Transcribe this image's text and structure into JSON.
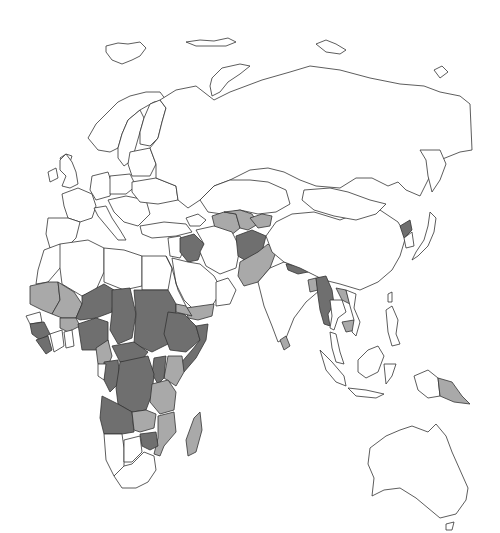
{
  "map": {
    "type": "choropleth",
    "region": "Eurasia, Africa and Oceania",
    "projection_hint": "equal-area-like",
    "colors": {
      "none": "#ffffff",
      "low": "#a9a9a9",
      "high": "#6f6f6f",
      "border": "#333333"
    },
    "categories": [
      "none",
      "low",
      "high"
    ],
    "shaded_countries": {
      "high": [
        "Mali",
        "Niger",
        "Chad",
        "Sudan",
        "Ethiopia",
        "Somalia",
        "Nigeria",
        "Central African Republic",
        "Democratic Republic of the Congo",
        "Angola",
        "Guinea",
        "Sierra Leone",
        "Liberia",
        "Guinea-Bissau",
        "Iraq",
        "Afghanistan",
        "Nepal",
        "Myanmar",
        "North Korea",
        "Zimbabwe",
        "Burundi",
        "Rwanda",
        "Uganda",
        "Congo"
      ],
      "low": [
        "Mauritania",
        "Burkina Faso",
        "Senegal",
        "Cameroon",
        "Kenya",
        "Tanzania",
        "Zambia",
        "Mozambique",
        "Malawi",
        "Madagascar",
        "Yemen",
        "Eritrea",
        "Pakistan",
        "Iran",
        "Turkmenistan",
        "Uzbekistan",
        "Tajikistan",
        "Kyrgyzstan",
        "Bangladesh",
        "Laos",
        "Cambodia",
        "Sri Lanka",
        "Papua New Guinea",
        "Ghana"
      ]
    }
  }
}
